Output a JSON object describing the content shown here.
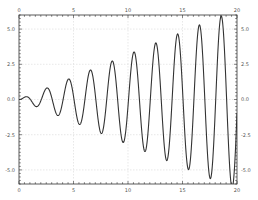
{
  "chart_data": {
    "type": "line",
    "title": "",
    "xlabel": "",
    "ylabel": "",
    "xlim": [
      0,
      20
    ],
    "ylim": [
      -6,
      6
    ],
    "grid": true,
    "legend": null,
    "x_ticks": [
      0,
      5,
      10,
      15,
      20
    ],
    "x_tick_labels": [
      "0",
      "5",
      "10",
      "15",
      "20"
    ],
    "y_ticks": [
      5.0,
      2.5,
      0.0,
      -2.5,
      -5.0
    ],
    "y_tick_labels": [
      "5.0",
      "2.5",
      "0.0",
      "-2.5",
      "-5.0"
    ],
    "x_minor_step": 0.5,
    "y_minor_step": 0.25,
    "series": [
      {
        "name": "signal",
        "color": "#333333",
        "description": "oscillation with linearly growing amplitude, approx y = 0.32*x*sin(pi*x - 0.15)",
        "peaks": [
          {
            "x": 0.65,
            "y": 0.15
          },
          {
            "x": 2.6,
            "y": 0.7
          },
          {
            "x": 10.55,
            "y": 3.33
          },
          {
            "x": 12.57,
            "y": 3.97
          },
          {
            "x": 14.6,
            "y": 4.6
          },
          {
            "x": 16.6,
            "y": 5.25
          },
          {
            "x": 18.6,
            "y": 5.96
          }
        ],
        "troughs": [
          {
            "x": 1.65,
            "y": -0.5
          }
        ],
        "amplitude_slope": 0.32,
        "period": 2.0,
        "phase": -0.15
      }
    ]
  },
  "colors": {
    "frame": "#333333",
    "grid": "#d8d8d8",
    "line": "#333333",
    "background": "#ffffff"
  }
}
